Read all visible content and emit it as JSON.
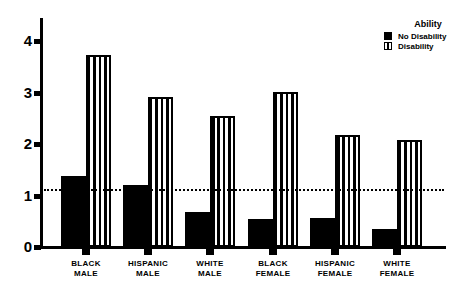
{
  "chart_data": {
    "type": "bar",
    "title": "",
    "xlabel": "",
    "ylabel": "",
    "ylim": [
      0,
      4.4
    ],
    "yticks": [
      0,
      1,
      2,
      3,
      4
    ],
    "categories": [
      "Black Male",
      "Hispanic Male",
      "White Male",
      "Black Female",
      "Hispanic Female",
      "White Female"
    ],
    "category_lines": [
      [
        "Black",
        "Male"
      ],
      [
        "Hispanic",
        "Male"
      ],
      [
        "White",
        "Male"
      ],
      [
        "Black",
        "Female"
      ],
      [
        "Hispanic",
        "Female"
      ],
      [
        "White",
        "Female"
      ]
    ],
    "series": [
      {
        "name": "No Disability",
        "pattern": "solid",
        "values": [
          1.38,
          1.2,
          0.68,
          0.55,
          0.56,
          0.35
        ]
      },
      {
        "name": "Disability",
        "pattern": "vertical-stripes",
        "values": [
          3.73,
          2.91,
          2.54,
          3.01,
          2.17,
          2.08
        ]
      }
    ],
    "reference_line": {
      "value": 1.1,
      "style": "dotted"
    },
    "legend": {
      "title": "Ability",
      "position": "top-right",
      "entries": [
        "No Disability",
        "Disability"
      ]
    },
    "grid": false
  },
  "colors": {
    "bar": "#000000",
    "background": "#ffffff"
  }
}
